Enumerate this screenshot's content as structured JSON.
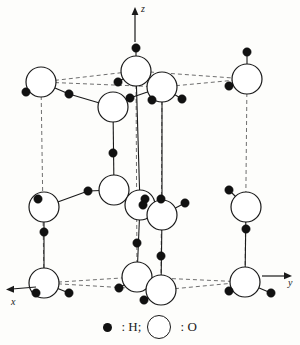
{
  "figure": {
    "background_color": "#fdfdfb"
  },
  "axes": {
    "z": {
      "label": "z",
      "direction": "up"
    },
    "x": {
      "label": "x",
      "direction": "left-down"
    },
    "y": {
      "label": "y",
      "direction": "right"
    }
  },
  "legend": {
    "hydrogen": {
      "symbol": "filled-circle",
      "separator": ":",
      "label": "H;",
      "color": "#111111"
    },
    "oxygen": {
      "symbol": "open-circle",
      "separator": ":",
      "label": "O",
      "color": "#ffffff"
    }
  },
  "chart_data": {
    "type": "scatter",
    "xlabel": "x",
    "ylabel": "y",
    "zlabel": "z",
    "oxygen_radius": 13,
    "hydrogen_radius": 4.2,
    "oxygen_atoms": [
      {
        "id": "O1",
        "x": 41,
        "y": 82,
        "r": 15
      },
      {
        "id": "O2",
        "x": 136,
        "y": 71,
        "r": 15
      },
      {
        "id": "O3",
        "x": 162,
        "y": 87,
        "r": 15
      },
      {
        "id": "O4",
        "x": 247,
        "y": 79,
        "r": 15
      },
      {
        "id": "O5",
        "x": 113,
        "y": 107,
        "r": 15
      },
      {
        "id": "O6",
        "x": 114,
        "y": 190,
        "r": 15
      },
      {
        "id": "O7",
        "x": 140,
        "y": 205,
        "r": 15
      },
      {
        "id": "O8",
        "x": 162,
        "y": 215,
        "r": 15
      },
      {
        "id": "O9",
        "x": 44,
        "y": 207,
        "r": 15
      },
      {
        "id": "O10",
        "x": 246,
        "y": 207,
        "r": 15
      },
      {
        "id": "O11",
        "x": 44,
        "y": 283,
        "r": 15
      },
      {
        "id": "O12",
        "x": 137,
        "y": 277,
        "r": 15
      },
      {
        "id": "O13",
        "x": 161,
        "y": 290,
        "r": 15
      },
      {
        "id": "O14",
        "x": 245,
        "y": 282,
        "r": 15
      }
    ],
    "hydrogen_atoms": [
      {
        "id": "H1",
        "x": 136,
        "y": 48
      },
      {
        "id": "H2",
        "x": 247,
        "y": 52
      },
      {
        "id": "H3",
        "x": 26,
        "y": 92
      },
      {
        "id": "H4",
        "x": 69,
        "y": 94
      },
      {
        "id": "H5",
        "x": 118,
        "y": 82
      },
      {
        "id": "H6",
        "x": 130,
        "y": 98
      },
      {
        "id": "H7",
        "x": 182,
        "y": 99
      },
      {
        "id": "H8",
        "x": 229,
        "y": 86
      },
      {
        "id": "H9",
        "x": 152,
        "y": 100
      },
      {
        "id": "H10",
        "x": 113,
        "y": 153
      },
      {
        "id": "H11",
        "x": 88,
        "y": 191
      },
      {
        "id": "H12",
        "x": 38,
        "y": 199
      },
      {
        "id": "H13",
        "x": 145,
        "y": 199
      },
      {
        "id": "H14",
        "x": 161,
        "y": 199
      },
      {
        "id": "H15",
        "x": 143,
        "y": 205
      },
      {
        "id": "H16",
        "x": 185,
        "y": 203
      },
      {
        "id": "H17",
        "x": 229,
        "y": 190
      },
      {
        "id": "H18",
        "x": 246,
        "y": 229
      },
      {
        "id": "H19",
        "x": 44,
        "y": 232
      },
      {
        "id": "H20",
        "x": 137,
        "y": 243
      },
      {
        "id": "H21",
        "x": 161,
        "y": 256
      },
      {
        "id": "H22",
        "x": 119,
        "y": 288
      },
      {
        "id": "H23",
        "x": 69,
        "y": 293
      },
      {
        "id": "H24",
        "x": 36,
        "y": 293
      },
      {
        "id": "H25",
        "x": 144,
        "y": 300
      },
      {
        "id": "H26",
        "x": 229,
        "y": 291
      },
      {
        "id": "H27",
        "x": 271,
        "y": 293
      }
    ],
    "bonds": [
      {
        "from": "O2",
        "to": "H1"
      },
      {
        "from": "O4",
        "to": "H2"
      },
      {
        "from": "O1",
        "to": "H3"
      },
      {
        "from": "O1",
        "to": "H4"
      },
      {
        "from": "H4",
        "to": "O5"
      },
      {
        "from": "O2",
        "to": "H5"
      },
      {
        "from": "O5",
        "to": "H6"
      },
      {
        "from": "H6",
        "to": "O3"
      },
      {
        "from": "O3",
        "to": "H7"
      },
      {
        "from": "O4",
        "to": "H8"
      },
      {
        "from": "O5",
        "to": "O6"
      },
      {
        "from": "O6",
        "to": "H11"
      },
      {
        "from": "H11",
        "to": "O9"
      },
      {
        "from": "O9",
        "to": "H12"
      },
      {
        "from": "O7",
        "to": "H13"
      },
      {
        "from": "O7",
        "to": "H15"
      },
      {
        "from": "O8",
        "to": "H16"
      },
      {
        "from": "O10",
        "to": "H17"
      },
      {
        "from": "O10",
        "to": "O14"
      },
      {
        "from": "O9",
        "to": "O11"
      },
      {
        "from": "O7",
        "to": "O12"
      },
      {
        "from": "O8",
        "to": "O13"
      },
      {
        "from": "O11",
        "to": "H23"
      },
      {
        "from": "O11",
        "to": "H24"
      },
      {
        "from": "O12",
        "to": "H22"
      },
      {
        "from": "O13",
        "to": "H25"
      },
      {
        "from": "O14",
        "to": "H26"
      },
      {
        "from": "O14",
        "to": "H27"
      },
      {
        "from": "O3",
        "to": "O8"
      },
      {
        "from": "O2",
        "to": "O7"
      }
    ],
    "cell_edges": [
      {
        "from": [
          41,
          82
        ],
        "to": [
          136,
          71
        ]
      },
      {
        "from": [
          136,
          71
        ],
        "to": [
          247,
          79
        ]
      },
      {
        "from": [
          41,
          82
        ],
        "to": [
          162,
          87
        ]
      },
      {
        "from": [
          162,
          87
        ],
        "to": [
          247,
          79
        ]
      },
      {
        "from": [
          41,
          82
        ],
        "to": [
          44,
          283
        ]
      },
      {
        "from": [
          136,
          71
        ],
        "to": [
          137,
          277
        ]
      },
      {
        "from": [
          162,
          87
        ],
        "to": [
          161,
          290
        ]
      },
      {
        "from": [
          247,
          79
        ],
        "to": [
          245,
          282
        ]
      },
      {
        "from": [
          44,
          283
        ],
        "to": [
          137,
          277
        ]
      },
      {
        "from": [
          137,
          277
        ],
        "to": [
          245,
          282
        ]
      },
      {
        "from": [
          44,
          283
        ],
        "to": [
          161,
          290
        ]
      },
      {
        "from": [
          161,
          290
        ],
        "to": [
          245,
          282
        ]
      }
    ],
    "grid": false,
    "legend_position": "bottom-center"
  }
}
